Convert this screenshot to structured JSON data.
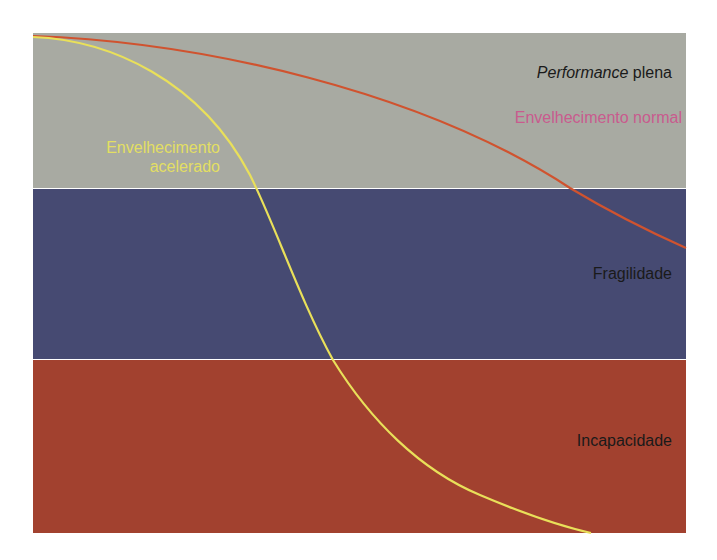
{
  "bands": [
    {
      "name": "performance-plena",
      "label_italic": "Performance",
      "label_rest": " plena",
      "color": "#a8aaa2",
      "top": 33,
      "height": 155
    },
    {
      "name": "fragilidade",
      "label": "Fragilidade",
      "color": "#464a72",
      "top": 189,
      "height": 170
    },
    {
      "name": "incapacidade",
      "label": "Incapacidade",
      "color": "#a2412f",
      "top": 360,
      "height": 173
    }
  ],
  "curves": {
    "normal": {
      "label": "Envelhecimento normal",
      "color": "#d0532f",
      "label_color": "#c95b8e"
    },
    "acelerado": {
      "label_line1": "Envelhecimento",
      "label_line2": "acelerado",
      "color": "#e9e05a",
      "label_color": "#e3df62"
    }
  },
  "chart_data": {
    "type": "line",
    "title": "",
    "xlabel": "",
    "ylabel": "",
    "regions": [
      "Performance plena",
      "Fragilidade",
      "Incapacidade"
    ],
    "series": [
      {
        "name": "Envelhecimento normal",
        "points_px": [
          [
            33,
            36
          ],
          [
            150,
            45
          ],
          [
            300,
            80
          ],
          [
            450,
            125
          ],
          [
            570,
            188
          ],
          [
            686,
            248
          ]
        ]
      },
      {
        "name": "Envelhecimento acelerado",
        "points_px": [
          [
            33,
            37
          ],
          [
            100,
            45
          ],
          [
            180,
            90
          ],
          [
            230,
            140
          ],
          [
            257,
            188
          ],
          [
            290,
            265
          ],
          [
            333,
            360
          ],
          [
            400,
            430
          ],
          [
            480,
            490
          ],
          [
            591,
            533
          ]
        ]
      }
    ],
    "grid": false,
    "legend": "inline labels"
  }
}
